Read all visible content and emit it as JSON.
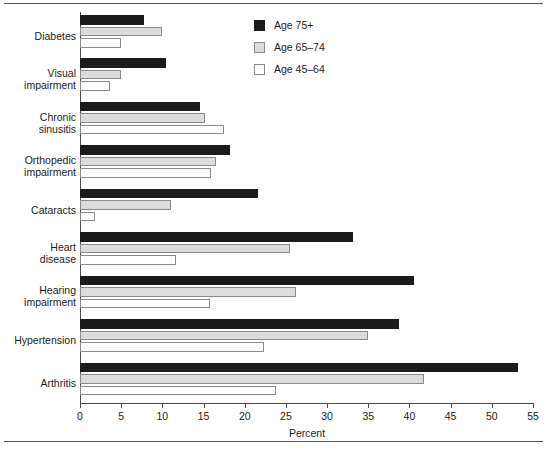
{
  "chart_data": {
    "type": "bar",
    "orientation": "horizontal",
    "title": "",
    "xlabel": "Percent",
    "ylabel": "",
    "xlim": [
      0,
      55
    ],
    "xticks": [
      0,
      5,
      10,
      15,
      20,
      25,
      30,
      35,
      40,
      45,
      50,
      55
    ],
    "grid": false,
    "legend_position": "top-right",
    "categories": [
      "Diabetes",
      "Visual impairment",
      "Chronic sinusitis",
      "Orthopedic impairment",
      "Cataracts",
      "Heart disease",
      "Hearing impairment",
      "Hypertension",
      "Arthritis"
    ],
    "category_lines": [
      [
        "Diabetes"
      ],
      [
        "Visual",
        "impairment"
      ],
      [
        "Chronic",
        "sinusitis"
      ],
      [
        "Orthopedic",
        "impairment"
      ],
      [
        "Cataracts"
      ],
      [
        "Heart",
        "disease"
      ],
      [
        "Hearing",
        "impairment"
      ],
      [
        "Hypertension"
      ],
      [
        "Arthritis"
      ]
    ],
    "series": [
      {
        "name": "Age 75+",
        "color": "#1b1b1b",
        "values": [
          7.8,
          10.5,
          14.6,
          18.2,
          21.6,
          33.1,
          40.5,
          38.7,
          53.2
        ]
      },
      {
        "name": "Age 65–74",
        "color": "#dcdcdc",
        "values": [
          10.0,
          5.0,
          15.2,
          16.5,
          11.0,
          25.5,
          26.2,
          35.0,
          41.8
        ]
      },
      {
        "name": "Age 45–64",
        "color": "#ffffff",
        "values": [
          5.0,
          3.7,
          17.5,
          15.9,
          1.8,
          11.7,
          15.8,
          22.4,
          23.8
        ]
      }
    ]
  },
  "legend": {
    "items": [
      {
        "label": "Age 75+"
      },
      {
        "label": "Age 65–74"
      },
      {
        "label": "Age 45–64"
      }
    ]
  }
}
